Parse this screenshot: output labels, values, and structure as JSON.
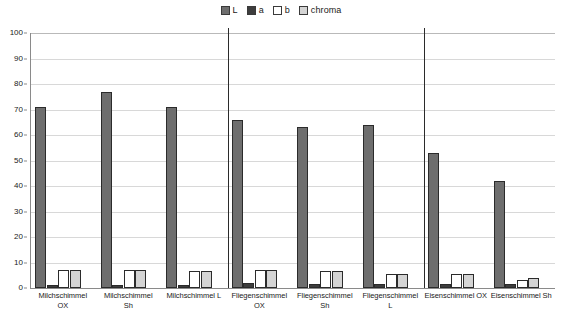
{
  "legend": {
    "position": "top-center",
    "entries": [
      {
        "label": "L",
        "color": "#6e6e6e",
        "name": "legend-swatch-l"
      },
      {
        "label": "a",
        "color": "#3d3d3d",
        "name": "legend-swatch-a"
      },
      {
        "label": "b",
        "color": "#ffffff",
        "name": "legend-swatch-b"
      },
      {
        "label": "chroma",
        "color": "#d4d4d4",
        "name": "legend-swatch-chroma"
      }
    ]
  },
  "chart_data": {
    "type": "bar",
    "title": "",
    "subtitle": "",
    "xlabel": "",
    "ylabel": "",
    "ylim": [
      0,
      100
    ],
    "yticks": [
      0,
      10,
      20,
      30,
      40,
      50,
      60,
      70,
      80,
      90,
      100
    ],
    "grid": true,
    "legend_position": "top-center",
    "group_separators_after": [
      "Milchschimmel L",
      "Fliegenschimmel L"
    ],
    "categories": [
      "Milchschimmel OX",
      "Milchschimmel Sh",
      "Milchschimmel L",
      "Fliegenschimmel OX",
      "Fliegenschimmel Sh",
      "Fliegenschimmel L",
      "Eisenschimmel OX",
      "Eisenschimmel Sh"
    ],
    "category_lines": [
      [
        "Milchschimmel",
        "OX"
      ],
      [
        "Milchschimmel",
        "Sh"
      ],
      [
        "Milchschimmel L",
        ""
      ],
      [
        "Fliegenschimmel",
        "OX"
      ],
      [
        "Fliegenschimmel",
        "Sh"
      ],
      [
        "Fliegenschimmel",
        "L"
      ],
      [
        "Eisenschimmel OX",
        ""
      ],
      [
        "Eisenschimmel Sh",
        ""
      ]
    ],
    "series": [
      {
        "name": "L",
        "color": "#6e6e6e",
        "values": [
          71,
          77,
          71,
          66,
          63,
          64,
          53,
          42
        ]
      },
      {
        "name": "a",
        "color": "#3d3d3d",
        "values": [
          1,
          1,
          1,
          2,
          1.5,
          1.5,
          1.5,
          1.5
        ]
      },
      {
        "name": "b",
        "color": "#ffffff",
        "values": [
          7,
          7,
          6.5,
          7,
          6.5,
          5.5,
          5.5,
          3
        ]
      },
      {
        "name": "chroma",
        "color": "#d4d4d4",
        "values": [
          7,
          7,
          6.5,
          7,
          6.5,
          5.5,
          5.5,
          4
        ]
      }
    ]
  }
}
